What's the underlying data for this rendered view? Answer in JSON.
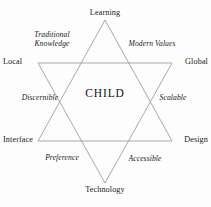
{
  "diagram": {
    "type": "hexagram-framework",
    "center_label": "CHILD",
    "line_color": "#9a9a9a",
    "text_color": "#1a1a1a",
    "background_color": "#fdfdfd",
    "vertices": [
      {
        "id": "learning",
        "label": "Learning",
        "position": "top"
      },
      {
        "id": "global",
        "label": "Global",
        "position": "upper-right"
      },
      {
        "id": "design",
        "label": "Design",
        "position": "lower-right"
      },
      {
        "id": "technology",
        "label": "Technology",
        "position": "bottom"
      },
      {
        "id": "interface",
        "label": "Interface",
        "position": "lower-left"
      },
      {
        "id": "local",
        "label": "Local",
        "position": "upper-left"
      }
    ],
    "edges": [
      {
        "id": "traditional-knowledge",
        "label": "Traditional Knowledge",
        "style": "italic",
        "position": "upper-left"
      },
      {
        "id": "modern-values",
        "label": "Modern Values",
        "style": "italic",
        "position": "upper-right"
      },
      {
        "id": "discernible",
        "label": "Discernible",
        "style": "italic",
        "position": "middle-left"
      },
      {
        "id": "scalable",
        "label": "Scalable",
        "style": "italic",
        "position": "middle-right"
      },
      {
        "id": "preference",
        "label": "Preference",
        "style": "italic",
        "position": "lower-left"
      },
      {
        "id": "accessible",
        "label": "Accessible",
        "style": "italic",
        "position": "lower-right"
      }
    ],
    "triangles": {
      "upward": {
        "points": "105,20 172,141 38,141"
      },
      "downward": {
        "points": "38,63 172,63 105,183"
      }
    }
  }
}
